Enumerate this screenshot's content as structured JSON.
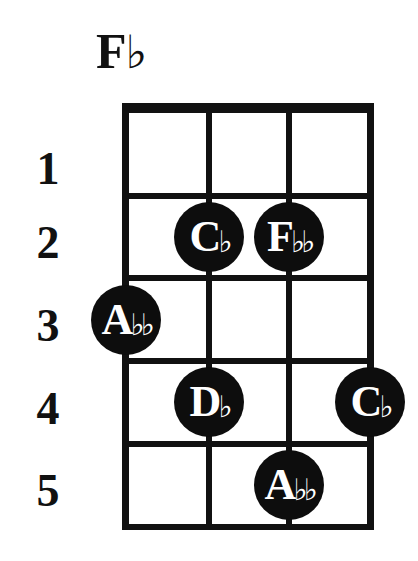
{
  "chord": {
    "name": "F♭",
    "root": "F",
    "accidental": "♭"
  },
  "fret_numbers": [
    "1",
    "2",
    "3",
    "4",
    "5"
  ],
  "grid": {
    "strings": 4,
    "frets": 5,
    "string_x": [
      126,
      209,
      289,
      370
    ],
    "fret_y": [
      108,
      196,
      278,
      361,
      444,
      527
    ],
    "line_color": "#111111"
  },
  "notes": [
    {
      "string": 2,
      "fret": 2,
      "letter": "C",
      "accidental": "♭"
    },
    {
      "string": 3,
      "fret": 2,
      "letter": "F",
      "accidental": "♭♭"
    },
    {
      "string": 1,
      "fret": 3,
      "letter": "A",
      "accidental": "♭♭"
    },
    {
      "string": 2,
      "fret": 4,
      "letter": "D",
      "accidental": "♭"
    },
    {
      "string": 4,
      "fret": 4,
      "letter": "C",
      "accidental": "♭"
    },
    {
      "string": 3,
      "fret": 5,
      "letter": "A",
      "accidental": "♭♭"
    }
  ]
}
